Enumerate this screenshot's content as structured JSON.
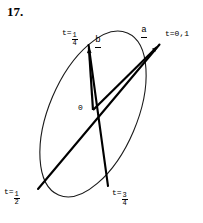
{
  "problem": {
    "number": "17."
  },
  "figure": {
    "caption_alt": "Tilted ellipse traced by vectors a and b with parameter markers",
    "origin_label": "0",
    "vectors": [
      {
        "name": "a",
        "label": "a",
        "underbar": true,
        "from": [
          93,
          110
        ],
        "to": [
          161,
          43
        ]
      },
      {
        "name": "b",
        "label": "b",
        "underbar": true,
        "from": [
          93,
          110
        ],
        "to": [
          88,
          42
        ]
      }
    ],
    "chords": [
      {
        "name": "chord-a-axis",
        "from": [
          38,
          189
        ],
        "to": [
          161,
          43
        ]
      },
      {
        "name": "chord-b-axis",
        "from": [
          108,
          186
        ],
        "to": [
          88,
          42
        ]
      }
    ],
    "ellipse": {
      "cx": 93,
      "cy": 114,
      "rx": 44,
      "ry": 88,
      "rotation_deg": 23,
      "stroke": "#1a1a1a",
      "stroke_width": 1
    },
    "markers": [
      {
        "name": "t-quarter",
        "t_text": "t=",
        "fraction": {
          "num": "1",
          "den": "4"
        },
        "x": 62,
        "y": 28,
        "align": "right",
        "point": [
          88,
          42
        ]
      },
      {
        "name": "t-zero-one",
        "t_text": "t=0,1",
        "fraction": null,
        "x": 166,
        "y": 29,
        "align": "left",
        "point": [
          161,
          43
        ]
      },
      {
        "name": "t-half",
        "t_text": "t=",
        "fraction": {
          "num": "1",
          "den": "2"
        },
        "x": 4,
        "y": 187,
        "align": "left",
        "point": [
          38,
          189
        ]
      },
      {
        "name": "t-three-quarters",
        "t_text": "t=",
        "fraction": {
          "num": "3",
          "den": "4"
        },
        "x": 112,
        "y": 188,
        "align": "left",
        "point": [
          108,
          186
        ]
      }
    ],
    "colors": {
      "ink": "#000000",
      "curve": "#1a1a1a",
      "background": "#ffffff"
    }
  }
}
